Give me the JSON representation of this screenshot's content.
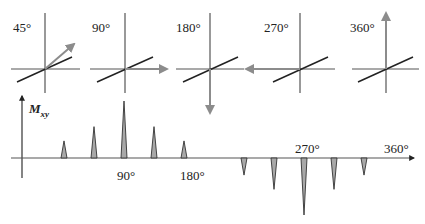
{
  "figure": {
    "colors": {
      "axis": "#555555",
      "diagonal": "#222222",
      "vector": "#8c8c8c",
      "peak_fill": "#a8a8a8",
      "peak_stroke": "#333333"
    }
  },
  "panels": [
    {
      "label": "45°",
      "angle_deg": 45,
      "vector_direction": "up-right"
    },
    {
      "label": "90°",
      "angle_deg": 90,
      "vector_direction": "right"
    },
    {
      "label": "180°",
      "angle_deg": 180,
      "vector_direction": "down"
    },
    {
      "label": "270°",
      "angle_deg": 270,
      "vector_direction": "left"
    },
    {
      "label": "360°",
      "angle_deg": 360,
      "vector_direction": "up"
    }
  ],
  "signal_plot": {
    "y_axis_label": "M",
    "y_axis_subscript": "xy",
    "tick_labels": [
      "90°",
      "180°",
      "270°",
      "360°"
    ]
  },
  "chart_data": {
    "type": "bar",
    "title": "",
    "xlabel": "rotation angle",
    "ylabel": "Mxy",
    "x_tick_labels": [
      "90°",
      "180°",
      "270°",
      "360°"
    ],
    "x": [
      30,
      60,
      90,
      120,
      150,
      210,
      240,
      270,
      300,
      330
    ],
    "values": [
      0.3,
      0.55,
      1.0,
      0.55,
      0.3,
      -0.3,
      -0.55,
      -1.0,
      -0.55,
      -0.3
    ],
    "xlim": [
      0,
      360
    ],
    "ylim": [
      -1.0,
      1.0
    ],
    "grid": false,
    "legend": "none"
  }
}
